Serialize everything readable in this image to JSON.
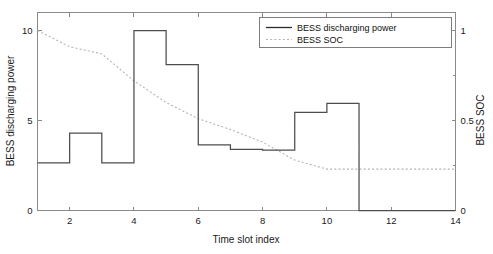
{
  "chart_data": {
    "type": "line",
    "title": "",
    "xlabel": "Time slot index",
    "ylabel": "BESS discharging power",
    "ylabel_right": "BESS SOC",
    "xlim": [
      1,
      14
    ],
    "ylim": [
      0,
      11
    ],
    "ylim_right": [
      0,
      1.1
    ],
    "grid": false,
    "legend_position": "top-right",
    "xticks": [
      2,
      4,
      6,
      8,
      10,
      12,
      14
    ],
    "xticklabels": [
      "2",
      "4",
      "6",
      "8",
      "10",
      "12",
      "14"
    ],
    "yticks": [
      0,
      5,
      10
    ],
    "yticklabels": [
      "0",
      "5",
      "10"
    ],
    "yticks_right": [
      0,
      0.5,
      1
    ],
    "yticklabels_right": [
      "0",
      "0.5",
      "1"
    ],
    "series": [
      {
        "name": "BESS discharging power",
        "style": "solid",
        "color": "#4d4d4d",
        "axis": "left",
        "drawstyle": "steps-post",
        "x": [
          1,
          2,
          3,
          4,
          5,
          6,
          7,
          8,
          9,
          10,
          11,
          12,
          13,
          14
        ],
        "values": [
          2.65,
          4.3,
          2.65,
          10.0,
          8.1,
          3.65,
          3.4,
          3.35,
          5.45,
          5.95,
          0,
          0,
          0,
          0
        ]
      },
      {
        "name": "BESS SOC",
        "style": "dotted",
        "color": "#b4b4b4",
        "axis": "right",
        "drawstyle": "line",
        "x": [
          1,
          2,
          3,
          4,
          5,
          6,
          7,
          8,
          9,
          10,
          11,
          12,
          13,
          14
        ],
        "values": [
          1.0,
          0.91,
          0.87,
          0.72,
          0.6,
          0.51,
          0.45,
          0.38,
          0.28,
          0.23,
          0.23,
          0.23,
          0.23,
          0.23
        ]
      }
    ]
  },
  "legend": {
    "entries": [
      {
        "label": "BESS discharging power",
        "marker": "solid-line"
      },
      {
        "label": "BESS SOC",
        "marker": "dotted-line"
      }
    ]
  },
  "axes": {
    "x_title": "Time slot index",
    "y_left_title": "BESS discharging power",
    "y_right_title": "BESS SOC"
  }
}
